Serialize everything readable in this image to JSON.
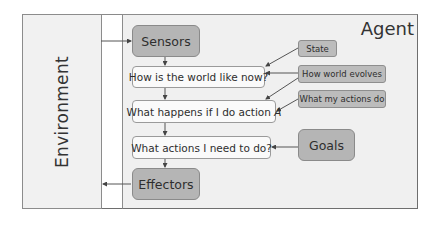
{
  "diagram": {
    "environment": {
      "label": "Environment"
    },
    "agent": {
      "label": "Agent"
    },
    "main_flow": [
      {
        "id": "sensors",
        "label": "Sensors"
      },
      {
        "id": "world_now",
        "label": "How is the world like now?"
      },
      {
        "id": "what_happens",
        "label": "What happens if I do action",
        "italic_suffix": "A"
      },
      {
        "id": "what_actions",
        "label": "What actions I need to do?"
      },
      {
        "id": "effectors",
        "label": "Effectors"
      }
    ],
    "inputs": [
      {
        "id": "state",
        "label": "State",
        "targets": [
          "world_now"
        ]
      },
      {
        "id": "how_world_evolves",
        "label": "How world evolves",
        "targets": [
          "world_now",
          "what_happens"
        ]
      },
      {
        "id": "what_my_actions_do",
        "label": "What my actions do",
        "targets": [
          "what_happens"
        ]
      },
      {
        "id": "goals",
        "label": "Goals",
        "targets": [
          "what_actions"
        ]
      }
    ],
    "edges": [
      [
        "environment",
        "sensors"
      ],
      [
        "sensors",
        "world_now"
      ],
      [
        "world_now",
        "what_happens"
      ],
      [
        "what_happens",
        "what_actions"
      ],
      [
        "what_actions",
        "effectors"
      ],
      [
        "effectors",
        "environment"
      ],
      [
        "state",
        "world_now"
      ],
      [
        "how_world_evolves",
        "world_now"
      ],
      [
        "how_world_evolves",
        "what_happens"
      ],
      [
        "what_my_actions_do",
        "what_happens"
      ],
      [
        "goals",
        "what_actions"
      ]
    ]
  }
}
